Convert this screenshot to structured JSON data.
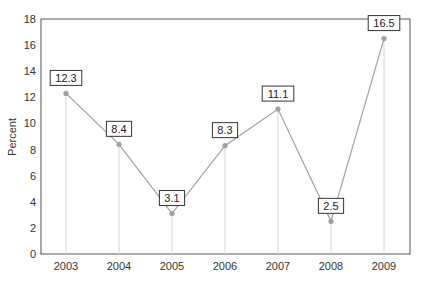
{
  "chart_data": {
    "type": "line",
    "title": "",
    "xlabel": "",
    "ylabel": "Percent",
    "categories": [
      "2003",
      "2004",
      "2005",
      "2006",
      "2007",
      "2008",
      "2009"
    ],
    "values": [
      12.3,
      8.4,
      3.1,
      8.3,
      11.1,
      2.5,
      16.5
    ],
    "labels": [
      "12.3",
      "8.4",
      "3.1",
      "8.3",
      "11.1",
      "2.5",
      "16.5"
    ],
    "ylim": [
      0,
      18
    ],
    "yticks": [
      "0",
      "2",
      "4",
      "6",
      "8",
      "10",
      "12",
      "14",
      "16",
      "18"
    ],
    "grid": false,
    "drop_lines": true,
    "legend": null,
    "colors": {
      "line": "#a0a0a0",
      "marker": "#a0a0a0",
      "drop_line": "#d8d8d8",
      "axis": "#555555"
    }
  }
}
